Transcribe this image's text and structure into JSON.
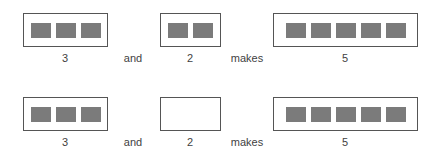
{
  "rows": [
    {
      "first": {
        "count": 3,
        "label": "3"
      },
      "conj": "and",
      "second": {
        "count": 2,
        "label": "2",
        "shown": 2
      },
      "verb": "makes",
      "result": {
        "count": 5,
        "label": "5"
      }
    },
    {
      "first": {
        "count": 3,
        "label": "3"
      },
      "conj": "and",
      "second": {
        "count": 2,
        "label": "2",
        "shown": 0
      },
      "verb": "makes",
      "result": {
        "count": 5,
        "label": "5"
      }
    }
  ],
  "colors": {
    "square": "#7b7b7b",
    "border": "#555555"
  }
}
